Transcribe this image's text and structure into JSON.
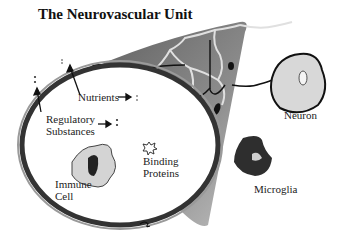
{
  "title": "The Neurovascular Unit",
  "labels": {
    "nutrients": "Nutrients",
    "regulatory_line1": "Regulatory",
    "regulatory_line2": "Substances",
    "binding_line1": "Binding",
    "binding_line2": "Proteins",
    "immune_line1": "Immune",
    "immune_line2": "Cell",
    "neuron": "Neuron",
    "microglia": "Microglia"
  },
  "icons": [
    "arrow-icon",
    "dot-pair-icon",
    "star-icon"
  ],
  "colors": {
    "vessel_wall": "#3a3a3a",
    "tissue_wedge": "#8a8a8a",
    "astrocyte_lines": "#d8d8d8",
    "cell_fill": "#d0d0d0",
    "text": "#222222"
  }
}
